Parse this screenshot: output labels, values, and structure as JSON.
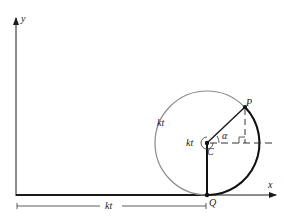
{
  "diagram": {
    "axes": {
      "x_label": "x",
      "y_label": "y"
    },
    "points": {
      "center": "C",
      "point_on_circle": "P",
      "contact_point": "Q"
    },
    "labels": {
      "arc_length": "kt",
      "rotation_angle": "kt",
      "angle": "α",
      "distance": "kt"
    },
    "colors": {
      "line": "#1a1a1a",
      "circle_light": "#8a8a8a",
      "arc_dark": "#111111"
    }
  }
}
